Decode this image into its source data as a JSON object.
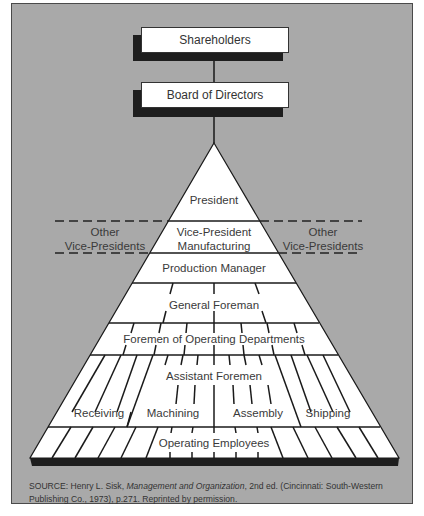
{
  "diagram": {
    "type": "organizational-pyramid",
    "top_boxes": [
      {
        "label": "Shareholders"
      },
      {
        "label": "Board of Directors"
      }
    ],
    "pyramid_levels": [
      {
        "label": "President"
      },
      {
        "label_line1": "Vice-President",
        "label_line2": "Manufacturing"
      },
      {
        "label": "Production Manager"
      },
      {
        "label": "General Foreman"
      },
      {
        "label": "Foremen of Operating Departments"
      },
      {
        "label": "Assistant Foremen",
        "departments": [
          "Receiving",
          "Machining",
          "Assembly",
          "Shipping"
        ]
      },
      {
        "label": "Operating Employees"
      }
    ],
    "side_labels": {
      "left": {
        "line1": "Other",
        "line2": "Vice-Presidents"
      },
      "right": {
        "line1": "Other",
        "line2": "Vice-Presidents"
      }
    },
    "source": {
      "prefix": "SOURCE:  Henry L. Sisk, ",
      "title": "Management and Organization",
      "suffix": ", 2nd ed. (Cincinnati: South-Western Publishing Co., 1973), p.271. Reprinted by permission."
    },
    "colors": {
      "background": "#a9a9a9",
      "box_fill": "#ffffff",
      "shadow": "#1e1e1e",
      "line": "#1a1a1a"
    }
  }
}
